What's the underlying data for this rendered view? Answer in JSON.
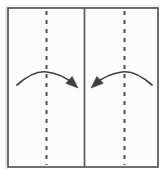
{
  "diagram": {
    "type": "folding-instruction",
    "canvas": {
      "width": 166,
      "height": 179
    },
    "background_color": "#ffffff",
    "paper": {
      "name": "paper-sheet",
      "x": 8,
      "y": 8,
      "width": 150,
      "height": 159,
      "fill_color": "#fcfcfc",
      "border_color": "#4a4a4a",
      "border_width": 1.6
    },
    "shadow": {
      "name": "paper-shadow",
      "color": "#d8d8d8",
      "offset_x": -2,
      "offset_y": -2
    },
    "center_divider": {
      "name": "center-vertical-line",
      "x": 84.5,
      "y_top": 8,
      "y_bottom": 167,
      "color": "#5f5f5f",
      "width": 1.8,
      "style": "solid"
    },
    "fold_lines": [
      {
        "name": "left-fold-line",
        "x": 46.5,
        "y_top": 11,
        "y_bottom": 165,
        "color": "#4f4f4f",
        "width": 2.0,
        "style": "dashed",
        "dash_length": 4,
        "gap_length": 5
      },
      {
        "name": "right-fold-line",
        "x": 124.5,
        "y_top": 11,
        "y_bottom": 165,
        "color": "#4f4f4f",
        "width": 2.0,
        "style": "dashed",
        "dash_length": 4,
        "gap_length": 5
      }
    ],
    "arrows": [
      {
        "name": "left-fold-arrow",
        "direction": "rightward-to-center",
        "color": "#3f3f3f",
        "stroke_width": 1.7,
        "path": "M 17 85 Q 34 70 47 72 Q 62 74 74 84",
        "head": {
          "tip_x": 78,
          "tip_y": 88,
          "angle_deg": 42,
          "size": 9
        }
      },
      {
        "name": "right-fold-arrow",
        "direction": "leftward-to-center",
        "color": "#3f3f3f",
        "stroke_width": 1.7,
        "path": "M 152 85 Q 135 70 122 72 Q 107 74 95 84",
        "head": {
          "tip_x": 91,
          "tip_y": 88,
          "angle_deg": 138,
          "size": 9
        }
      }
    ]
  }
}
